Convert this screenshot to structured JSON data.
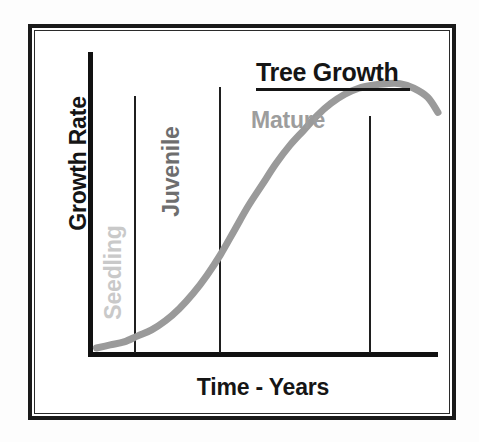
{
  "figure": {
    "frame_color": "#1a1a1a",
    "background_color": "#ffffff"
  },
  "chart_data": {
    "type": "line",
    "title": "Tree Growth",
    "xlabel": "Time - Years",
    "ylabel": "Growth Rate",
    "grid": false,
    "legend_position": "none",
    "xlim": [
      0,
      100
    ],
    "ylim": [
      0,
      100
    ],
    "axis_tick_labels": {
      "x": [],
      "y": []
    },
    "series": [
      {
        "name": "Growth Rate",
        "color": "#9a9a9a",
        "x": [
          1,
          5,
          9,
          13,
          17,
          21,
          25,
          29,
          33,
          37,
          41,
          45,
          49,
          53,
          57,
          61,
          65,
          69,
          73,
          77,
          81,
          85,
          89,
          93,
          97,
          100
        ],
        "y": [
          2,
          3,
          4,
          6,
          8,
          11,
          15,
          20,
          26,
          33,
          41,
          49,
          56,
          63,
          69,
          74,
          79,
          83,
          86,
          88,
          89,
          89.5,
          89.5,
          88,
          85,
          80
        ]
      }
    ],
    "annotations": [
      {
        "name": "seedling",
        "label": "Seedling",
        "color": "#c9c9c9",
        "orientation": "vertical",
        "zone_x_range": [
          0,
          13
        ]
      },
      {
        "name": "juvenile",
        "label": "Juvenile",
        "color": "#6e6e6e",
        "orientation": "vertical",
        "zone_x_range": [
          13,
          38
        ]
      },
      {
        "name": "mature",
        "label": "Mature",
        "color": "#9d9d9d",
        "orientation": "horizontal",
        "zone_x_range": [
          38,
          81
        ]
      }
    ],
    "vertical_dividers": [
      {
        "name": "seedling-juvenile-divider",
        "x": 13
      },
      {
        "name": "juvenile-mature-divider",
        "x": 38
      },
      {
        "name": "mature-decline-divider",
        "x": 81
      }
    ]
  }
}
